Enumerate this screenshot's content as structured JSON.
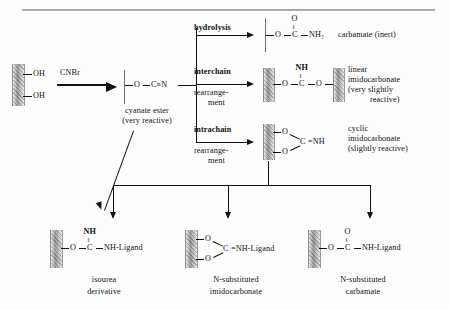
{
  "diagram": {
    "top_rule": true
  },
  "start": {
    "support_label": "matrix-support",
    "group1": "OH",
    "group2": "OH",
    "reagent": "CNBr"
  },
  "cyanate_ester": {
    "formula_o": "O",
    "bond": "—",
    "formula_cn": "C≡N",
    "label_line1": "cyanate ester",
    "label_line2": "(very reactive)"
  },
  "branches": [
    {
      "name": "hydrolysis",
      "condition_line1": "hydrolysis",
      "condition_line2": "",
      "condition_line3": "",
      "product": {
        "top_atom": "O",
        "double_bond": "‖",
        "left": "O",
        "center": "C",
        "right": "NH₂",
        "support_style": "line"
      },
      "label_line1": "carbamate (inert)",
      "label_line2": "",
      "label_line3": ""
    },
    {
      "name": "interchain-rearrangement",
      "condition_line1": "interchain",
      "condition_line2": "rearrange-",
      "condition_line3": "ment",
      "product": {
        "top_atom": "NH",
        "double_bond": "‖",
        "left": "O",
        "center": "C",
        "right": "O",
        "support_style": "double-block"
      },
      "label_line1": "linear",
      "label_line2": "imidocarbonate",
      "label_line3": "(very slightly",
      "label_line4": "reactive)"
    },
    {
      "name": "intrachain-rearrangement",
      "condition_line1": "intrachain",
      "condition_line2": "rearrange-",
      "condition_line3": "ment",
      "product": {
        "top_atom": "O",
        "bottom_atom": "O",
        "center": "C",
        "right": "=NH",
        "support_style": "block-cyclic"
      },
      "label_line1": "cyclic",
      "label_line2": "imidocarbonate",
      "label_line3": "(slightly reactive)"
    }
  ],
  "products": [
    {
      "name": "isourea-derivative",
      "top_atom": "NH",
      "double_bond": "‖",
      "left": "O",
      "center": "C",
      "right": "NH-Ligand",
      "kind": "linear",
      "label_line1": "isourea",
      "label_line2": "derivative"
    },
    {
      "name": "n-substituted-imidocarbonate",
      "top_atom": "O",
      "bottom_atom": "O",
      "center": "C",
      "right": "=NH-Ligand",
      "kind": "cyclic",
      "label_line1": "N-substituted",
      "label_line2": "imidocarbonate"
    },
    {
      "name": "n-substituted-carbamate",
      "top_atom": "O",
      "double_bond": "‖",
      "left": "O",
      "center": "C",
      "right": "NH-Ligand",
      "kind": "linear",
      "label_line1": "N-substituted",
      "label_line2": "carbamate"
    }
  ],
  "colors": {
    "ink": "#111111",
    "support_gray": "#9f9f9f",
    "rule_gray": "#8a8a8a",
    "background": "#fdfdfd"
  }
}
